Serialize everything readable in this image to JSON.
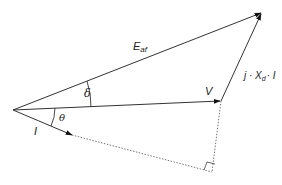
{
  "diagram": {
    "type": "phasor-diagram",
    "origin": {
      "x": 13,
      "y": 110
    },
    "colors": {
      "line": "#333333",
      "dotted": "#777777",
      "background": "#ffffff"
    },
    "phasors": [
      {
        "id": "E_af",
        "label_main": "E",
        "label_sub": "af",
        "tip": {
          "x": 262,
          "y": 12
        }
      },
      {
        "id": "V",
        "label_main": "V",
        "tip": {
          "x": 221,
          "y": 101
        }
      },
      {
        "id": "I",
        "label_main": "I",
        "tip": {
          "x": 72,
          "y": 135
        }
      },
      {
        "id": "jXdI",
        "label_prefix": "j · X",
        "label_sub": "d",
        "label_suffix": "· I",
        "from": {
          "x": 221,
          "y": 101
        },
        "tip": {
          "x": 262,
          "y": 12
        }
      }
    ],
    "angles": [
      {
        "id": "delta",
        "label": "δ",
        "between": [
          "V",
          "E_af"
        ]
      },
      {
        "id": "theta",
        "label": "θ",
        "between": [
          "I",
          "V"
        ]
      }
    ],
    "construction": {
      "dotted_extension_of_I_to": {
        "x": 212,
        "y": 172
      },
      "right_angle_marker_at": {
        "x": 212,
        "y": 172
      }
    }
  }
}
